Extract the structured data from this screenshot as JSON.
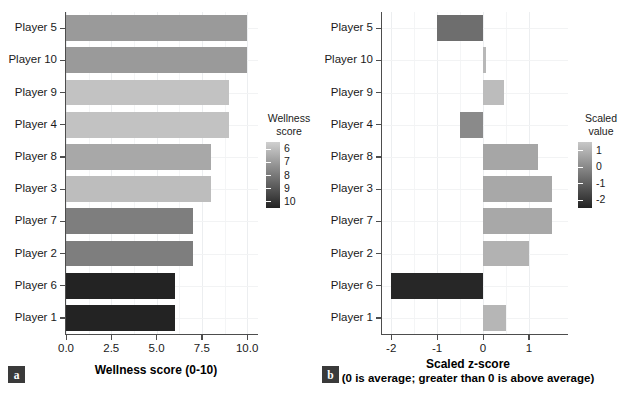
{
  "figure": {
    "panels": [
      {
        "tag": "a",
        "tag_name": "panel-tag-a",
        "xlabel": "Wellness score (0-10)",
        "xlabel_sub": "",
        "legend_title_line1": "Wellness",
        "legend_title_line2": "score",
        "legend_labels": [
          "6",
          "7",
          "8",
          "9",
          "10"
        ],
        "xticks": [
          "0.0",
          "2.5",
          "5.0",
          "7.5",
          "10.0"
        ]
      },
      {
        "tag": "b",
        "tag_name": "panel-tag-b",
        "xlabel": "Scaled z-score",
        "xlabel_sub": "(0 is average; greater than 0 is above average)",
        "legend_title_line1": "Scaled",
        "legend_title_line2": "value",
        "legend_labels": [
          "1",
          "0",
          "-1",
          "-2"
        ],
        "xticks": [
          "-2",
          "-1",
          "0",
          "1"
        ]
      }
    ],
    "categories": [
      "Player 5",
      "Player 10",
      "Player 9",
      "Player 4",
      "Player 8",
      "Player 3",
      "Player 7",
      "Player 2",
      "Player 6",
      "Player 1"
    ],
    "colors": {
      "bar_light": "#c2c2c2",
      "bar_mid": "#9a9a9a",
      "bar_dark": "#232323",
      "grid": "#eceef0",
      "axis": "#4d4d4d",
      "tag_bg": "#3a3a3a"
    }
  },
  "chart_data": [
    {
      "type": "bar",
      "orientation": "horizontal",
      "panel": "a",
      "title": "",
      "xlabel": "Wellness score (0-10)",
      "ylabel": "",
      "xlim": [
        0,
        10.6
      ],
      "xticks": [
        0.0,
        2.5,
        5.0,
        7.5,
        10.0
      ],
      "xticklabels": [
        "0.0",
        "2.5",
        "5.0",
        "7.5",
        "10.0"
      ],
      "grid": true,
      "legend": {
        "title": "Wellness score",
        "type": "continuous-colorbar",
        "ticks": [
          6,
          7,
          8,
          9,
          10
        ],
        "ticklabels": [
          "6",
          "7",
          "8",
          "9",
          "10"
        ],
        "low_color": "#232323",
        "high_color": "#d0d0d0",
        "position": "right"
      },
      "categories": [
        "Player 5",
        "Player 10",
        "Player 9",
        "Player 4",
        "Player 8",
        "Player 3",
        "Player 7",
        "Player 2",
        "Player 6",
        "Player 1"
      ],
      "values": [
        10,
        10,
        9,
        9,
        8,
        8,
        7,
        7,
        6,
        6
      ],
      "bar_colors": [
        "#9a9a9a",
        "#9a9a9a",
        "#c2c2c2",
        "#c2c2c2",
        "#a8a8a8",
        "#bdbdbd",
        "#7e7e7e",
        "#7e7e7e",
        "#232323",
        "#232323"
      ]
    },
    {
      "type": "bar",
      "orientation": "horizontal",
      "panel": "b",
      "title": "",
      "xlabel": "Scaled z-score (0 is average; greater than 0 is above average)",
      "ylabel": "",
      "xlim": [
        -2.2,
        1.85
      ],
      "xticks": [
        -2,
        -1,
        0,
        1
      ],
      "xticklabels": [
        "-2",
        "-1",
        "0",
        "1"
      ],
      "grid": true,
      "legend": {
        "title": "Scaled value",
        "type": "continuous-colorbar",
        "ticks": [
          1,
          0,
          -1,
          -2
        ],
        "ticklabels": [
          "1",
          "0",
          "-1",
          "-2"
        ],
        "low_color": "#232323",
        "high_color": "#c8c8c8",
        "position": "right"
      },
      "categories": [
        "Player 5",
        "Player 10",
        "Player 9",
        "Player 4",
        "Player 8",
        "Player 3",
        "Player 7",
        "Player 2",
        "Player 6",
        "Player 1"
      ],
      "values": [
        -1.0,
        0.06,
        0.45,
        -0.5,
        1.2,
        1.5,
        1.5,
        1.0,
        -2.0,
        0.5
      ],
      "bar_colors": [
        "#6e6e6e",
        "#b8b8b8",
        "#bcbcbc",
        "#8a8a8a",
        "#a6a6a6",
        "#a8a8a8",
        "#a8a8a8",
        "#b2b2b2",
        "#272727",
        "#b6b6b6"
      ]
    }
  ]
}
